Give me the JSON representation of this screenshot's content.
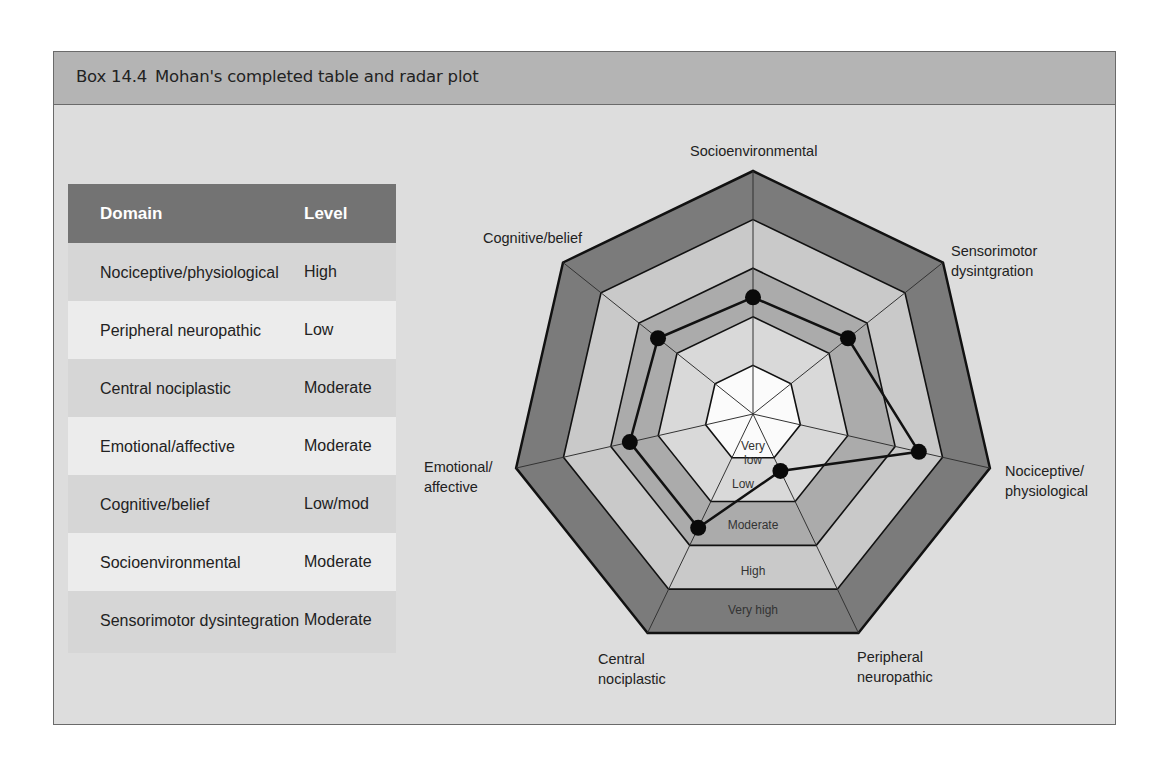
{
  "box": {
    "number": "Box 14.4",
    "title": "Mohan's completed table and radar plot"
  },
  "table": {
    "headers": {
      "domain": "Domain",
      "level": "Level"
    },
    "rows": [
      {
        "domain": "Nociceptive/physiological",
        "level": "High"
      },
      {
        "domain": "Peripheral neuropathic",
        "level": "Low"
      },
      {
        "domain": "Central nociplastic",
        "level": "Moderate"
      },
      {
        "domain": "Emotional/affective",
        "level": "Moderate"
      },
      {
        "domain": "Cognitive/belief",
        "level": "Low/mod"
      },
      {
        "domain": "Socioenvironmental",
        "level": "Moderate"
      },
      {
        "domain": "Sensorimotor dysintegration",
        "level": "Moderate"
      }
    ]
  },
  "radar": {
    "axis_labels": {
      "socioenvironmental": "Socioenvironmental",
      "sensorimotor_1": "Sensorimotor",
      "sensorimotor_2": "dysintgration",
      "nociceptive_1": "Nociceptive/",
      "nociceptive_2": "physiological",
      "peripheral_1": "Peripheral",
      "peripheral_2": "neuropathic",
      "central_1": "Central",
      "central_2": "nociplastic",
      "emotional_1": "Emotional/",
      "emotional_2": "affective",
      "cognitive": "Cognitive/belief"
    },
    "ring_labels": {
      "very_low_1": "Very",
      "very_low_2": "low",
      "low": "Low",
      "moderate": "Moderate",
      "high": "High",
      "very_high": "Very high"
    },
    "colors": {
      "very_high": "#7b7b7b",
      "high": "#c9c9c9",
      "moderate": "#ababab",
      "low": "#d9d9d9",
      "very_low": "#fbfbfb"
    }
  },
  "chart_data": {
    "type": "radar",
    "title": "Mohan's completed table and radar plot",
    "scale": [
      "Very low",
      "Low",
      "Moderate",
      "High",
      "Very high"
    ],
    "axes": [
      "Socioenvironmental",
      "Sensorimotor dysintegration",
      "Nociceptive/physiological",
      "Peripheral neuropathic",
      "Central nociplastic",
      "Emotional/affective",
      "Cognitive/belief"
    ],
    "values": [
      2.4,
      2.5,
      3.5,
      1.3,
      2.6,
      2.6,
      2.5
    ],
    "value_labels": [
      "Moderate",
      "Moderate",
      "High",
      "Low",
      "Moderate",
      "Moderate",
      "Low/mod"
    ]
  }
}
